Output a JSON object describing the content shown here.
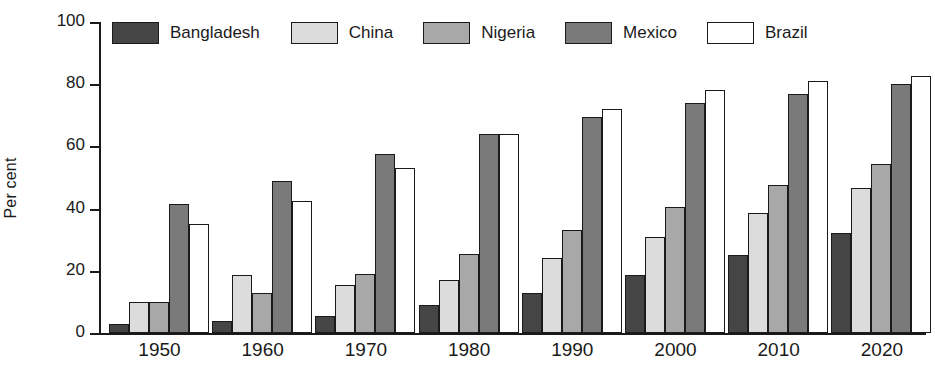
{
  "chart_data": {
    "type": "bar",
    "title": "",
    "xlabel": "",
    "ylabel": "Per cent",
    "ylim": [
      0,
      100
    ],
    "yticks": [
      "0",
      "20",
      "40",
      "60",
      "80",
      "100"
    ],
    "grid": false,
    "legend_position": "top",
    "categories": [
      "1950",
      "1960",
      "1970",
      "1980",
      "1990",
      "2000",
      "2010",
      "2020"
    ],
    "series": [
      {
        "name": "Bangladesh",
        "color": "#454545",
        "values": [
          3,
          4,
          5.5,
          9,
          13,
          18.5,
          25,
          32
        ]
      },
      {
        "name": "China",
        "color": "#dcdcdc",
        "values": [
          10,
          18.5,
          15.5,
          17,
          24,
          31,
          38.5,
          46.5
        ]
      },
      {
        "name": "Nigeria",
        "color": "#a8a8a8",
        "values": [
          10,
          13,
          19,
          25.5,
          33,
          40.5,
          47.5,
          54.5
        ]
      },
      {
        "name": "Mexico",
        "color": "#7a7a7a",
        "values": [
          41.5,
          49,
          57.5,
          64,
          69.5,
          74,
          77,
          80
        ]
      },
      {
        "name": "Brazil",
        "color": "#ffffff",
        "values": [
          35,
          42.5,
          53,
          64,
          72,
          78,
          81,
          82.5
        ]
      }
    ]
  }
}
